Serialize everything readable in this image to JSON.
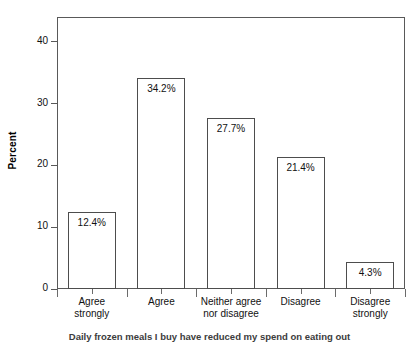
{
  "chart_data": {
    "type": "bar",
    "title": "",
    "xlabel": "",
    "ylabel": "Percent",
    "categories": [
      "Agree strongly",
      "Agree",
      "Neither agree nor disagree",
      "Disagree",
      "Disagree strongly"
    ],
    "category_lines": [
      [
        "Agree",
        "strongly"
      ],
      [
        "Agree",
        ""
      ],
      [
        "Neither agree",
        "nor disagree"
      ],
      [
        "Disagree",
        ""
      ],
      [
        "Disagree",
        "strongly"
      ]
    ],
    "values": [
      12.4,
      34.2,
      27.7,
      21.4,
      4.3
    ],
    "value_labels": [
      "12.4%",
      "34.2%",
      "27.7%",
      "21.4%",
      "4.3%"
    ],
    "ylim": [
      0,
      44
    ],
    "yticks": [
      0,
      10,
      20,
      30,
      40
    ],
    "ytick_labels": [
      "0",
      "10",
      "20",
      "30",
      "40"
    ],
    "grid": false,
    "legend": "none",
    "bar_fill": "#ffffff",
    "bar_stroke": "#4d4d4d",
    "frame_color": "#595959",
    "background": "#ffffff"
  },
  "caption": {
    "text": "Daily frozen meals I buy have reduced my spend on eating out"
  }
}
